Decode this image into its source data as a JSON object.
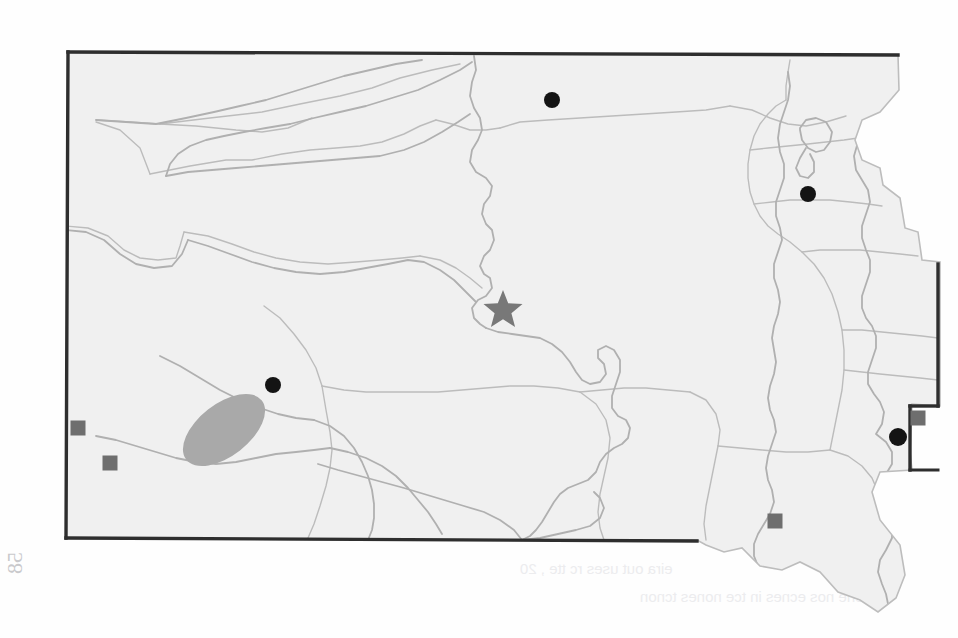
{
  "figure": {
    "kind": "distribution-map",
    "region_name": "South Dakota",
    "scan_artifact_note": "faint mirrored show-through text from reverse side of page",
    "page_number_mark": "58"
  },
  "colors": {
    "state_fill": "#f0f0f0",
    "state_border": "#333333",
    "county_line": "#b9b9b9",
    "river_line": "#b2b2b2",
    "star_marker": "#777777",
    "circle_marker": "#111111",
    "square_marker": "#6e6e6e",
    "shaded_region": "#a9a9a9",
    "background": "#ffffff",
    "bleed_text": "#dedee1"
  },
  "markers": {
    "star": [
      {
        "name": "star-capital",
        "x": 503,
        "y": 307,
        "size": 17
      }
    ],
    "circles": [
      {
        "name": "circle-north-central",
        "x": 552,
        "y": 100,
        "r": 8
      },
      {
        "name": "circle-northeast",
        "x": 808,
        "y": 194,
        "r": 8
      },
      {
        "name": "circle-black-hills",
        "x": 273,
        "y": 385,
        "r": 8
      },
      {
        "name": "circle-east-border",
        "x": 898,
        "y": 437,
        "r": 9
      }
    ],
    "squares": [
      {
        "name": "square-southwest-upper",
        "x": 78,
        "y": 428,
        "size": 15
      },
      {
        "name": "square-southwest-lower",
        "x": 110,
        "y": 463,
        "size": 15
      },
      {
        "name": "square-east-border",
        "x": 918,
        "y": 418,
        "size": 15
      },
      {
        "name": "square-southeast",
        "x": 775,
        "y": 521,
        "size": 15
      }
    ],
    "shaded_regions": [
      {
        "name": "black-hills-ellipse",
        "cx": 224,
        "cy": 430,
        "rx": 48,
        "ry": 26,
        "rotation_deg": -38
      }
    ]
  },
  "bleed_text": {
    "line1": "gr Serix and his wuck',  and  han halves  Do' ore",
    "line2": "mio  We will  Pusn  cha",
    "scatter": [
      "nameiav",
      "wes  tail",
      "A  vne  ranhe  Amov",
      "he  eorn  mes ti",
      "uarne  oeiter",
      "ow  ain  es  te  an  tnnes",
      "Te  'ar ce",
      "se  tnenn  ooa  cies",
      "taes que  ii.3",
      "eira out  uses  rc  tte  ,  20",
      "an ehe nos  ecnes  in tce nones  tcnon",
      "arane aeen  ta  er  tie  ies",
      "ae  enee  tas  ces  atn  te"
    ]
  }
}
